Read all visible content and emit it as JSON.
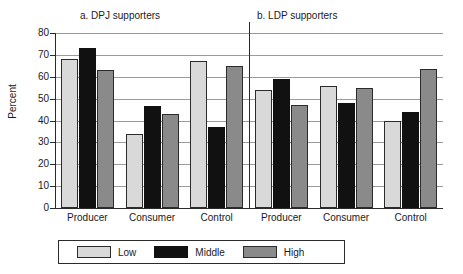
{
  "chart_data": {
    "type": "bar",
    "title": "",
    "ylabel": "Percent",
    "xlabel": "",
    "ylim": [
      0,
      80
    ],
    "ytick_step": 10,
    "yticks": [
      "80",
      "70",
      "60",
      "50",
      "40",
      "30",
      "20",
      "10",
      "0"
    ],
    "grid": true,
    "legend_position": "bottom",
    "legend": [
      "Low",
      "Middle",
      "High"
    ],
    "series": [
      {
        "name": "Low",
        "color": "#d9d9d9"
      },
      {
        "name": "Middle",
        "color": "#111111"
      },
      {
        "name": "High",
        "color": "#8a8a8a"
      }
    ],
    "panels": [
      {
        "title": "a. DPJ supporters",
        "categories": [
          "Producer",
          "Consumer",
          "Control"
        ],
        "series": [
          {
            "name": "Low",
            "values": [
              68,
              34,
              67
            ]
          },
          {
            "name": "Middle",
            "values": [
              73,
              46.5,
              37
            ]
          },
          {
            "name": "High",
            "values": [
              63,
              43,
              65
            ]
          }
        ]
      },
      {
        "title": "b. LDP supporters",
        "categories": [
          "Producer",
          "Consumer",
          "Control"
        ],
        "series": [
          {
            "name": "Low",
            "values": [
              54,
              56,
              40
            ]
          },
          {
            "name": "Middle",
            "values": [
              59,
              48,
              44
            ]
          },
          {
            "name": "High",
            "values": [
              47,
              55,
              63.5
            ]
          }
        ]
      }
    ]
  }
}
